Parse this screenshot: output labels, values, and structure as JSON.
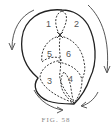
{
  "figure": {
    "caption": "FIG. 58",
    "stroke_color": "#222222",
    "regions": [
      {
        "id": "1",
        "label": "1"
      },
      {
        "id": "2",
        "label": "2"
      },
      {
        "id": "3",
        "label": "3"
      },
      {
        "id": "4",
        "label": "4"
      },
      {
        "id": "5",
        "label": "5"
      },
      {
        "id": "6",
        "label": "6"
      }
    ],
    "arrows": [
      {
        "name": "left-top-arrow",
        "direction": "counter-clockwise"
      },
      {
        "name": "right-arrow",
        "direction": "clockwise"
      },
      {
        "name": "bottom-left-arrow",
        "direction": "toward-bottom-point"
      },
      {
        "name": "bottom-right-arrow",
        "direction": "toward-bottom-point"
      }
    ]
  }
}
